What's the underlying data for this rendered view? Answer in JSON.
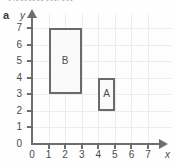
{
  "figure": {
    "part_label": "a",
    "top_cut_text": "congruent",
    "x_axis_name": "x",
    "y_axis_name": "y"
  },
  "chart_data": {
    "type": "scatter",
    "title": "",
    "xlabel": "x",
    "ylabel": "y",
    "xlim": [
      0,
      7
    ],
    "ylim": [
      0,
      7
    ],
    "xticks": [
      0,
      1,
      2,
      3,
      4,
      5,
      6,
      7
    ],
    "yticks": [
      0,
      1,
      2,
      3,
      4,
      5,
      6,
      7
    ],
    "xtick_labels": [
      "0",
      "1",
      "2",
      "3",
      "4",
      "5",
      "6",
      "7"
    ],
    "ytick_labels": [
      "0",
      "1",
      "2",
      "3",
      "4",
      "5",
      "6",
      "7"
    ],
    "grid": true,
    "legend": "none",
    "shapes": [
      {
        "name": "B",
        "label": "B",
        "type": "rectangle",
        "x_min": 1,
        "x_max": 3,
        "y_min": 3,
        "y_max": 7,
        "width": 2,
        "height": 4,
        "vertices": [
          [
            1,
            3
          ],
          [
            3,
            3
          ],
          [
            3,
            7
          ],
          [
            1,
            7
          ]
        ],
        "label_position": [
          2,
          5
        ],
        "fill": "#fafafa",
        "stroke": "#6a6a6a"
      },
      {
        "name": "A",
        "label": "A",
        "type": "rectangle",
        "x_min": 4,
        "x_max": 5,
        "y_min": 2,
        "y_max": 4,
        "width": 1,
        "height": 2,
        "vertices": [
          [
            4,
            2
          ],
          [
            5,
            2
          ],
          [
            5,
            4
          ],
          [
            4,
            4
          ]
        ],
        "label_position": [
          4.5,
          3
        ],
        "fill": "#fafafa",
        "stroke": "#6a6a6a"
      }
    ]
  },
  "colors": {
    "axis": "#6e6e6e",
    "grid": "#ececec",
    "shape_stroke": "#6a6a6a",
    "shape_fill": "#fafafa",
    "text": "#4a4a4a",
    "background": "#fefefe"
  }
}
